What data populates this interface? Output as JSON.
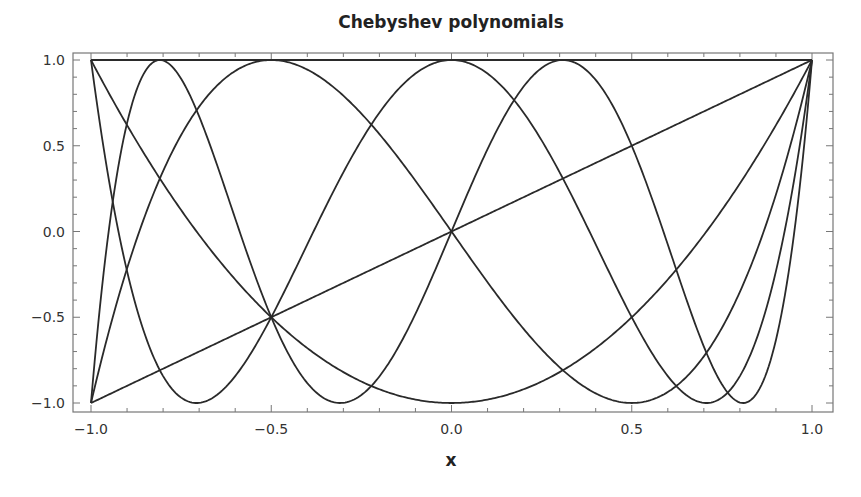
{
  "chart_data": {
    "type": "line",
    "title": "Chebyshev polynomials",
    "xlabel": "x",
    "ylabel": "",
    "xlim": [
      -1.0,
      1.0
    ],
    "ylim": [
      -1.0,
      1.0
    ],
    "grid": false,
    "legend": null,
    "x_ticks": [
      "-1.0",
      "-0.5",
      "0.0",
      "0.5",
      "1.0"
    ],
    "y_ticks": [
      "-1.0",
      "-0.5",
      "0.0",
      "0.5",
      "1.0"
    ],
    "series": [
      {
        "name": "T0(x)",
        "degree": 0,
        "color": "#2a2a2a",
        "x": [
          -1,
          1
        ],
        "y": [
          1,
          1
        ]
      },
      {
        "name": "T1(x)",
        "degree": 1,
        "color": "#2a2a2a",
        "x": [
          -1,
          0,
          1
        ],
        "y": [
          -1,
          0,
          1
        ]
      },
      {
        "name": "T2(x)",
        "degree": 2,
        "color": "#2a2a2a",
        "x": [
          -1,
          -0.5,
          0,
          0.5,
          1
        ],
        "y": [
          1,
          -0.5,
          -1,
          -0.5,
          1
        ]
      },
      {
        "name": "T3(x)",
        "degree": 3,
        "color": "#2a2a2a",
        "x": [
          -1,
          -0.5,
          0,
          0.5,
          1
        ],
        "y": [
          -1,
          1,
          0,
          -1,
          1
        ]
      },
      {
        "name": "T4(x)",
        "degree": 4,
        "color": "#2a2a2a",
        "x": [
          -1,
          -0.707,
          -0.5,
          0,
          0.5,
          0.707,
          1
        ],
        "y": [
          1,
          -1,
          -0.5,
          1,
          -0.5,
          -1,
          1
        ]
      },
      {
        "name": "T5(x)",
        "degree": 5,
        "color": "#2a2a2a",
        "x": [
          -1,
          -0.809,
          -0.5,
          -0.309,
          0,
          0.309,
          0.5,
          0.809,
          1
        ],
        "y": [
          -1,
          1,
          -0.5,
          -1,
          0,
          1,
          0.5,
          -1,
          1
        ]
      }
    ]
  },
  "colors": {
    "curve": "#2a2a2a",
    "frame": "#777777",
    "background": "#ffffff"
  }
}
